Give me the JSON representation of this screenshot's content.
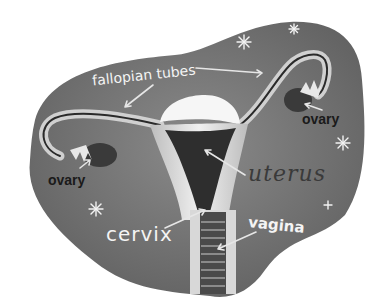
{
  "figure": {
    "background_color": "#ffffff",
    "blob_color": "#6e6e6e",
    "organ_light_color": "#d8d8d8",
    "organ_dark_color": "#2e2e2e"
  },
  "labels": {
    "fallopian_tubes": "fallopian tubes",
    "ovary_right": "ovary",
    "ovary_left": "ovary",
    "uterus": "uterus",
    "cervix": "cervix",
    "vagina": "vagina"
  },
  "decorations": {
    "stars": [
      {
        "x": 244,
        "y": 42
      },
      {
        "x": 294,
        "y": 29
      },
      {
        "x": 343,
        "y": 143
      },
      {
        "x": 96,
        "y": 209
      },
      {
        "x": 328,
        "y": 205
      }
    ]
  }
}
